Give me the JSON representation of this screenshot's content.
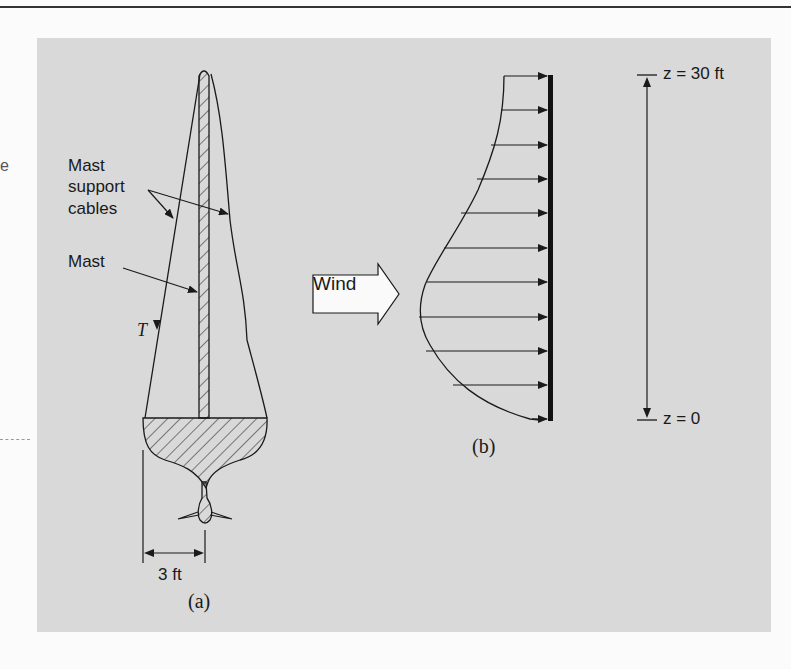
{
  "figure": {
    "panel_a": {
      "caption": "(a)",
      "labels": {
        "cables_line1": "Mast",
        "cables_line2": "support",
        "cables_line3": "cables",
        "mast": "Mast",
        "tension": "T",
        "dimension": "3 ft"
      }
    },
    "panel_b": {
      "caption": "(b)",
      "wind_label": "Wind",
      "top_label": "z = 30 ft",
      "bottom_label": "z = 0",
      "profile_arrow_count": 11
    },
    "colors": {
      "panel_bg": "#d9d9d9",
      "ink": "#1a1a1a",
      "page_bg": "#fbfbfb"
    }
  }
}
